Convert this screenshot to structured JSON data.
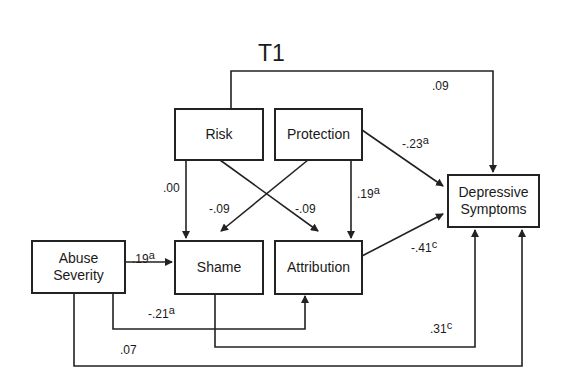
{
  "title": "T1",
  "nodes": {
    "risk": "Risk",
    "protection": "Protection",
    "shame": "Shame",
    "attribution": "Attribution",
    "abuse_severity_line1": "Abuse",
    "abuse_severity_line2": "Severity",
    "depressive_line1": "Depressive",
    "depressive_line2": "Symptoms"
  },
  "paths": [
    {
      "id": "risk_to_depressive",
      "value": ".09",
      "sup": ""
    },
    {
      "id": "protection_to_depressive",
      "value": "-.23",
      "sup": "a"
    },
    {
      "id": "risk_to_shame",
      "value": ".00",
      "sup": ""
    },
    {
      "id": "protection_to_shame",
      "value": "-.09",
      "sup": ""
    },
    {
      "id": "risk_to_attribution",
      "value": "-.09",
      "sup": ""
    },
    {
      "id": "protection_to_attribution",
      "value": ".19",
      "sup": "a"
    },
    {
      "id": "attribution_to_depressive",
      "value": "-.41",
      "sup": "c"
    },
    {
      "id": "abuse_to_shame",
      "value": ".19",
      "sup": "a"
    },
    {
      "id": "abuse_to_attribution",
      "value": "-.21",
      "sup": "a"
    },
    {
      "id": "shame_to_depressive",
      "value": ".31",
      "sup": "c"
    },
    {
      "id": "abuse_to_depressive",
      "value": ".07",
      "sup": ""
    }
  ]
}
